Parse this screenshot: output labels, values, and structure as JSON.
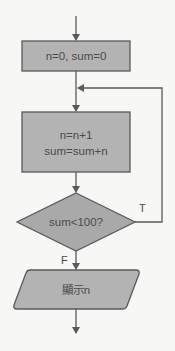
{
  "diagram": {
    "type": "flowchart",
    "colors": {
      "background": "#f7f7f5",
      "shape_fill": "#b3b3b3",
      "stroke": "#5a5a5a",
      "text": "#4a4a4a"
    },
    "nodes": {
      "init": {
        "shape": "rectangle",
        "text": "n=0, sum=0"
      },
      "process": {
        "shape": "rectangle",
        "line1": "n=n+1",
        "line2": "sum=sum+n"
      },
      "decision": {
        "shape": "diamond",
        "text": "sum<100?"
      },
      "output": {
        "shape": "parallelogram",
        "text": "顯示n"
      }
    },
    "edges": {
      "true_label": "T",
      "false_label": "F"
    }
  }
}
